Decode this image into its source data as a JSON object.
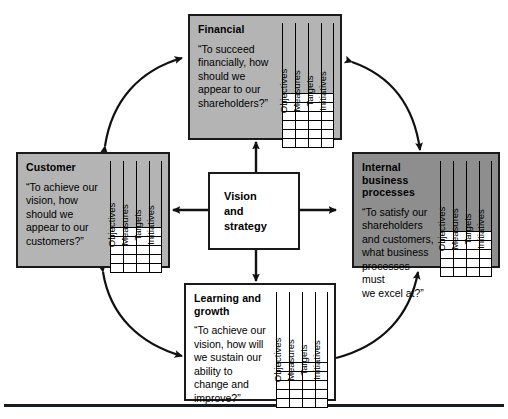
{
  "diagram": {
    "name": "Balanced Scorecard framework",
    "center": {
      "label": "Vision\nand\nstrategy"
    },
    "column_headers": [
      "Objectives",
      "Measures",
      "Targets",
      "Initiatives"
    ],
    "perspectives": [
      {
        "key": "financial",
        "title": "Financial",
        "question": "“To succeed\nfinancially, how\nshould we\nappear to our\nshareholders?”",
        "fill": "#b4b4b4",
        "shaded": true,
        "rows": 6
      },
      {
        "key": "customer",
        "title": "Customer",
        "question": "“To achieve our\nvision, how\nshould we\nappear to our\ncustomers?”",
        "fill": "#b4b4b4",
        "shaded": true,
        "rows": 5
      },
      {
        "key": "internal-business-processes",
        "title": "Internal business\nprocesses",
        "question": "“To satisfy our\nshareholders\nand customers,\nwhat business\nprocesses must\nwe excel at?”",
        "fill": "#8e8e8e",
        "shaded": true,
        "rows": 5
      },
      {
        "key": "learning-and-growth",
        "title": "Learning and\ngrowth",
        "question": "“To achieve our\nvision, how will\nwe sustain our\nability to\nchange and\nimprove?”",
        "fill": "#ffffff",
        "shaded": false,
        "rows": 5
      }
    ],
    "connectors": {
      "center_to_perspective": [
        "up-arrow",
        "left-arrow",
        "right-arrow",
        "down-arrow"
      ],
      "circular_double_arrows": [
        "customer-financial",
        "financial-internal-business-processes",
        "customer-learning-and-growth",
        "learning-and-growth-internal-business-processes"
      ]
    },
    "colors": {
      "stroke": "#1a1a1a",
      "shade_light": "#b4b4b4",
      "shade_dark": "#8e8e8e",
      "cell_fill": "#ffffff",
      "rule": "#161d22"
    }
  }
}
